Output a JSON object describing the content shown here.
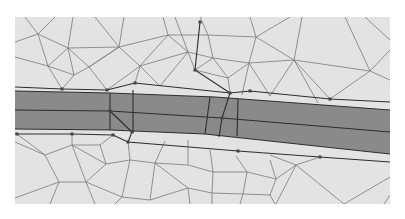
{
  "diagram": {
    "type": "triangular-mesh",
    "colors": {
      "page": "#ffffff",
      "mesh_background": "#e3e3e3",
      "band_fill": "#8a8a8a",
      "mesh_line": "#7a7a7a",
      "band_line": "#2e2e2e",
      "node": "#444444"
    },
    "frame": {
      "x": 15,
      "y": 17,
      "w": 375,
      "h": 187
    },
    "band": {
      "top": [
        [
          15,
          91
        ],
        [
          110,
          93
        ],
        [
          215,
          97
        ],
        [
          390,
          110
        ]
      ],
      "mid": [
        [
          15,
          110
        ],
        [
          110,
          111
        ],
        [
          222,
          118
        ],
        [
          390,
          132
        ]
      ],
      "bottom": [
        [
          15,
          129
        ],
        [
          110,
          130
        ],
        [
          205,
          134
        ],
        [
          390,
          154
        ]
      ]
    },
    "breaklines": [
      [
        [
          15,
          87
        ],
        [
          62,
          89
        ],
        [
          107,
          90
        ],
        [
          135,
          83
        ],
        [
          230,
          93
        ],
        [
          250,
          91
        ],
        [
          330,
          99
        ],
        [
          390,
          102
        ]
      ],
      [
        [
          15,
          134
        ],
        [
          72,
          134
        ],
        [
          113,
          135
        ],
        [
          128,
          142
        ],
        [
          238,
          151
        ],
        [
          320,
          157
        ],
        [
          390,
          162
        ]
      ]
    ],
    "structure_lines": [
      [
        [
          200,
          22
        ],
        [
          195,
          70
        ],
        [
          230,
          93
        ],
        [
          222,
          118
        ],
        [
          219,
          137
        ]
      ],
      [
        [
          110,
          93
        ],
        [
          110,
          130
        ]
      ],
      [
        [
          110,
          111
        ],
        [
          132,
          132
        ],
        [
          128,
          142
        ]
      ],
      [
        [
          133,
          90
        ],
        [
          133,
          133
        ]
      ],
      [
        [
          210,
          97
        ],
        [
          205,
          134
        ]
      ],
      [
        [
          238,
          99
        ],
        [
          237,
          136
        ]
      ]
    ],
    "nodes": [
      [
        62,
        89
      ],
      [
        107,
        90
      ],
      [
        135,
        83
      ],
      [
        200,
        22
      ],
      [
        195,
        70
      ],
      [
        230,
        93
      ],
      [
        250,
        91
      ],
      [
        330,
        99
      ],
      [
        110,
        111
      ],
      [
        132,
        132
      ],
      [
        128,
        142
      ],
      [
        113,
        135
      ],
      [
        72,
        134
      ],
      [
        17,
        134
      ],
      [
        222,
        118
      ],
      [
        238,
        151
      ],
      [
        320,
        157
      ]
    ],
    "mesh_edges": [
      [
        [
          15,
          42
        ],
        [
          38,
          34
        ]
      ],
      [
        [
          38,
          34
        ],
        [
          68,
          48
        ]
      ],
      [
        [
          68,
          48
        ],
        [
          119,
          47
        ]
      ],
      [
        [
          119,
          47
        ],
        [
          168,
          35
        ]
      ],
      [
        [
          168,
          35
        ],
        [
          208,
          35
        ]
      ],
      [
        [
          208,
          35
        ],
        [
          256,
          37
        ]
      ],
      [
        [
          256,
          37
        ],
        [
          294,
          60
        ]
      ],
      [
        [
          294,
          60
        ],
        [
          370,
          71
        ]
      ],
      [
        [
          370,
          71
        ],
        [
          390,
          80
        ]
      ],
      [
        [
          38,
          34
        ],
        [
          48,
          66
        ]
      ],
      [
        [
          48,
          66
        ],
        [
          68,
          48
        ]
      ],
      [
        [
          68,
          48
        ],
        [
          74,
          75
        ]
      ],
      [
        [
          74,
          75
        ],
        [
          48,
          66
        ]
      ],
      [
        [
          15,
          57
        ],
        [
          48,
          66
        ]
      ],
      [
        [
          48,
          66
        ],
        [
          62,
          89
        ]
      ],
      [
        [
          74,
          75
        ],
        [
          62,
          89
        ]
      ],
      [
        [
          74,
          75
        ],
        [
          89,
          67
        ]
      ],
      [
        [
          89,
          67
        ],
        [
          119,
          47
        ]
      ],
      [
        [
          119,
          47
        ],
        [
          89,
          67
        ]
      ],
      [
        [
          68,
          48
        ],
        [
          89,
          67
        ]
      ],
      [
        [
          89,
          67
        ],
        [
          107,
          90
        ]
      ],
      [
        [
          119,
          47
        ],
        [
          140,
          66
        ]
      ],
      [
        [
          140,
          66
        ],
        [
          107,
          90
        ]
      ],
      [
        [
          140,
          66
        ],
        [
          135,
          83
        ]
      ],
      [
        [
          119,
          47
        ],
        [
          124,
          17
        ]
      ],
      [
        [
          68,
          48
        ],
        [
          73,
          17
        ]
      ],
      [
        [
          38,
          34
        ],
        [
          25,
          17
        ]
      ],
      [
        [
          38,
          34
        ],
        [
          55,
          17
        ]
      ],
      [
        [
          119,
          47
        ],
        [
          95,
          17
        ]
      ],
      [
        [
          140,
          66
        ],
        [
          168,
          35
        ]
      ],
      [
        [
          168,
          35
        ],
        [
          188,
          52
        ]
      ],
      [
        [
          188,
          52
        ],
        [
          140,
          66
        ]
      ],
      [
        [
          168,
          35
        ],
        [
          163,
          17
        ]
      ],
      [
        [
          188,
          52
        ],
        [
          195,
          70
        ]
      ],
      [
        [
          188,
          52
        ],
        [
          213,
          58
        ]
      ],
      [
        [
          213,
          58
        ],
        [
          208,
          35
        ]
      ],
      [
        [
          208,
          35
        ],
        [
          200,
          17
        ]
      ],
      [
        [
          213,
          58
        ],
        [
          249,
          63
        ]
      ],
      [
        [
          249,
          63
        ],
        [
          256,
          37
        ]
      ],
      [
        [
          256,
          37
        ],
        [
          250,
          17
        ]
      ],
      [
        [
          256,
          37
        ],
        [
          290,
          17
        ]
      ],
      [
        [
          249,
          63
        ],
        [
          294,
          60
        ]
      ],
      [
        [
          294,
          60
        ],
        [
          302,
          17
        ]
      ],
      [
        [
          294,
          60
        ],
        [
          270,
          96
        ]
      ],
      [
        [
          249,
          63
        ],
        [
          270,
          96
        ]
      ],
      [
        [
          249,
          63
        ],
        [
          242,
          95
        ]
      ],
      [
        [
          213,
          58
        ],
        [
          228,
          78
        ]
      ],
      [
        [
          228,
          78
        ],
        [
          249,
          63
        ]
      ],
      [
        [
          228,
          78
        ],
        [
          230,
          93
        ]
      ],
      [
        [
          195,
          70
        ],
        [
          228,
          78
        ]
      ],
      [
        [
          213,
          58
        ],
        [
          195,
          70
        ]
      ],
      [
        [
          140,
          66
        ],
        [
          160,
          86
        ]
      ],
      [
        [
          160,
          86
        ],
        [
          188,
          52
        ]
      ],
      [
        [
          294,
          60
        ],
        [
          318,
          103
        ]
      ],
      [
        [
          370,
          71
        ],
        [
          390,
          50
        ]
      ],
      [
        [
          370,
          71
        ],
        [
          345,
          17
        ]
      ],
      [
        [
          370,
          71
        ],
        [
          330,
          99
        ]
      ],
      [
        [
          294,
          60
        ],
        [
          330,
          99
        ]
      ],
      [
        [
          390,
          40
        ],
        [
          365,
          17
        ]
      ],
      [
        [
          188,
          52
        ],
        [
          175,
          17
        ]
      ],
      [
        [
          15,
          142
        ],
        [
          45,
          155
        ]
      ],
      [
        [
          45,
          155
        ],
        [
          59,
          182
        ]
      ],
      [
        [
          59,
          182
        ],
        [
          15,
          198
        ]
      ],
      [
        [
          45,
          155
        ],
        [
          72,
          145
        ]
      ],
      [
        [
          72,
          145
        ],
        [
          86,
          182
        ]
      ],
      [
        [
          86,
          182
        ],
        [
          59,
          182
        ]
      ],
      [
        [
          72,
          145
        ],
        [
          100,
          145
        ]
      ],
      [
        [
          100,
          145
        ],
        [
          106,
          164
        ]
      ],
      [
        [
          106,
          164
        ],
        [
          86,
          182
        ]
      ],
      [
        [
          106,
          164
        ],
        [
          130,
          160
        ]
      ],
      [
        [
          130,
          160
        ],
        [
          122,
          197
        ]
      ],
      [
        [
          122,
          197
        ],
        [
          86,
          182
        ]
      ],
      [
        [
          106,
          164
        ],
        [
          72,
          145
        ]
      ],
      [
        [
          59,
          182
        ],
        [
          50,
          204
        ]
      ],
      [
        [
          86,
          182
        ],
        [
          95,
          204
        ]
      ],
      [
        [
          122,
          197
        ],
        [
          115,
          204
        ]
      ],
      [
        [
          130,
          160
        ],
        [
          155,
          163
        ]
      ],
      [
        [
          155,
          163
        ],
        [
          150,
          200
        ]
      ],
      [
        [
          150,
          200
        ],
        [
          122,
          197
        ]
      ],
      [
        [
          155,
          163
        ],
        [
          188,
          165
        ]
      ],
      [
        [
          188,
          165
        ],
        [
          213,
          172
        ]
      ],
      [
        [
          213,
          172
        ],
        [
          212,
          193
        ]
      ],
      [
        [
          212,
          193
        ],
        [
          188,
          188
        ]
      ],
      [
        [
          188,
          188
        ],
        [
          155,
          163
        ]
      ],
      [
        [
          188,
          188
        ],
        [
          150,
          200
        ]
      ],
      [
        [
          188,
          188
        ],
        [
          190,
          204
        ]
      ],
      [
        [
          212,
          193
        ],
        [
          212,
          204
        ]
      ],
      [
        [
          213,
          172
        ],
        [
          247,
          172
        ]
      ],
      [
        [
          247,
          172
        ],
        [
          243,
          194
        ]
      ],
      [
        [
          243,
          194
        ],
        [
          212,
          193
        ]
      ],
      [
        [
          243,
          194
        ],
        [
          270,
          195
        ]
      ],
      [
        [
          270,
          195
        ],
        [
          275,
          204
        ]
      ],
      [
        [
          243,
          194
        ],
        [
          240,
          204
        ]
      ],
      [
        [
          247,
          172
        ],
        [
          276,
          179
        ]
      ],
      [
        [
          276,
          179
        ],
        [
          270,
          195
        ]
      ],
      [
        [
          276,
          179
        ],
        [
          296,
          165
        ]
      ],
      [
        [
          296,
          165
        ],
        [
          320,
          157
        ]
      ],
      [
        [
          296,
          165
        ],
        [
          276,
          204
        ]
      ],
      [
        [
          296,
          165
        ],
        [
          344,
          204
        ]
      ],
      [
        [
          344,
          204
        ],
        [
          390,
          177
        ]
      ],
      [
        [
          276,
          179
        ],
        [
          270,
          160
        ]
      ],
      [
        [
          247,
          172
        ],
        [
          236,
          156
        ]
      ],
      [
        [
          213,
          172
        ],
        [
          210,
          150
        ]
      ],
      [
        [
          188,
          165
        ],
        [
          188,
          140
        ]
      ],
      [
        [
          155,
          163
        ],
        [
          165,
          141
        ]
      ],
      [
        [
          130,
          160
        ],
        [
          128,
          142
        ]
      ],
      [
        [
          45,
          155
        ],
        [
          17,
          134
        ]
      ],
      [
        [
          72,
          145
        ],
        [
          72,
          134
        ]
      ],
      [
        [
          100,
          145
        ],
        [
          113,
          135
        ]
      ],
      [
        [
          390,
          195
        ],
        [
          384,
          204
        ]
      ],
      [
        [
          296,
          165
        ],
        [
          270,
          155
        ]
      ]
    ]
  }
}
